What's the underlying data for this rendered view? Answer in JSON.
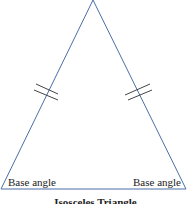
{
  "diagram": {
    "title": "Isosceles Triangle",
    "labels": {
      "left_base_angle": "Base angle",
      "right_base_angle": "Base angle"
    },
    "colors": {
      "stroke": "#4a6fa5",
      "tick": "#444444",
      "text": "#222222"
    },
    "shape": {
      "type": "triangle",
      "apex": [
        93,
        0
      ],
      "base_left": [
        1,
        189
      ],
      "base_right": [
        186,
        189
      ],
      "equal_side_marks": "double-tick"
    }
  }
}
